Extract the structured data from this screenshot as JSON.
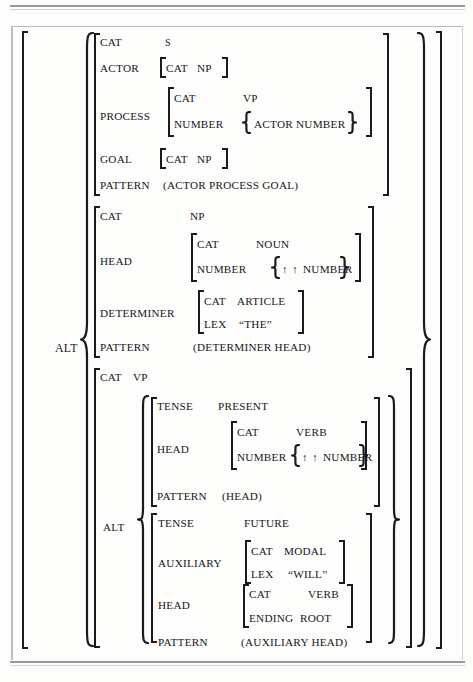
{
  "figure": {
    "type": "feature-structure-diagram",
    "notation": {
      "square_bracket": "feature matrix (conjunction of attribute-value pairs)",
      "curly_brace": "alternation / disjunction set",
      "up_arrow": "↑",
      "double_up_arrow": "↑ ↑"
    },
    "colors": {
      "ink": "#16161a",
      "paper": "#fdfdfc",
      "frame": "#9a9a9a"
    }
  },
  "outer": {
    "alt_label": "ALT"
  },
  "alternative_s": {
    "rows": {
      "cat_key": "CAT",
      "cat_val": "S",
      "actor_key": "ACTOR",
      "actor_cat_key": "CAT",
      "actor_cat_val": "NP",
      "process_key": "PROCESS",
      "process_cat_key": "CAT",
      "process_cat_val": "VP",
      "process_number_key": "NUMBER",
      "process_number_val": "ACTOR NUMBER",
      "goal_key": "GOAL",
      "goal_cat_key": "CAT",
      "goal_cat_val": "NP",
      "pattern_key": "PATTERN",
      "pattern_val": "(ACTOR PROCESS GOAL)"
    }
  },
  "alternative_np": {
    "rows": {
      "cat_key": "CAT",
      "cat_val": "NP",
      "head_key": "HEAD",
      "head_cat_key": "CAT",
      "head_cat_val": "NOUN",
      "head_number_key": "NUMBER",
      "head_number_arrows": "↑ ↑",
      "head_number_val": "NUMBER",
      "determiner_key": "DETERMINER",
      "determiner_cat_key": "CAT",
      "determiner_cat_val": "ARTICLE",
      "determiner_lex_key": "LEX",
      "determiner_lex_val": "“THE”",
      "pattern_key": "PATTERN",
      "pattern_val": "(DETERMINER HEAD)"
    }
  },
  "alternative_vp": {
    "rows": {
      "cat_key": "CAT",
      "cat_val": "VP",
      "alt_label": "ALT"
    },
    "present": {
      "tense_key": "TENSE",
      "tense_val": "PRESENT",
      "head_key": "HEAD",
      "head_cat_key": "CAT",
      "head_cat_val": "VERB",
      "head_number_key": "NUMBER",
      "head_number_arrows": "↑ ↑",
      "head_number_val": "NUMBER",
      "pattern_key": "PATTERN",
      "pattern_val": "(HEAD)"
    },
    "future": {
      "tense_key": "TENSE",
      "tense_val": "FUTURE",
      "auxiliary_key": "AUXILIARY",
      "auxiliary_cat_key": "CAT",
      "auxiliary_cat_val": "MODAL",
      "auxiliary_lex_key": "LEX",
      "auxiliary_lex_val": "“WILL”",
      "head_key": "HEAD",
      "head_cat_key": "CAT",
      "head_cat_val": "VERB",
      "head_ending_key": "ENDING",
      "head_ending_val": "ROOT",
      "pattern_key": "PATTERN",
      "pattern_val": "(AUXILIARY HEAD)"
    }
  }
}
